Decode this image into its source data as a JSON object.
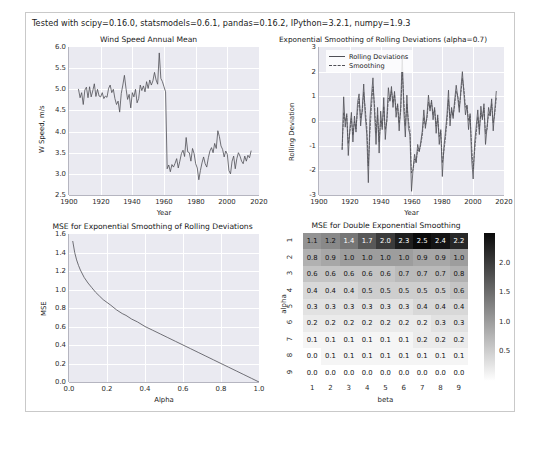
{
  "figure": {
    "note": "Tested with scipy=0.16.0, statsmodels=0.6.1, pandas=0.16.2, IPython=3.2.1, numpy=1.9.3",
    "background": "#ffffff",
    "axes_facecolor": "#eaeaf1",
    "grid_color": "#ffffff",
    "line_color": "#4f4f56"
  },
  "chart_data": [
    {
      "type": "line",
      "name": "wind-speed-annual-mean",
      "title": "Wind Speed Annual Mean",
      "xlabel": "Year",
      "ylabel": "W Speed, m/s",
      "xlim": [
        1900,
        2020
      ],
      "ylim": [
        2.5,
        6.0
      ],
      "xticks": [
        1900,
        1920,
        1940,
        1960,
        1980,
        2000,
        2020
      ],
      "xticklabels": [
        "1900",
        "1920",
        "1940",
        "1960",
        "1980",
        "2000",
        "2020"
      ],
      "yticks": [
        2.5,
        3.0,
        3.5,
        4.0,
        4.5,
        5.0,
        5.5,
        6.0
      ],
      "yticklabels": [
        "2.5",
        "3.0",
        "3.5",
        "4.0",
        "4.5",
        "5.0",
        "5.5",
        "6.0"
      ],
      "grid": true,
      "legend": null,
      "series": [
        {
          "name": "Wind Speed Annual Mean",
          "x": [
            1906,
            1907,
            1908,
            1909,
            1910,
            1911,
            1912,
            1913,
            1914,
            1915,
            1916,
            1917,
            1918,
            1919,
            1920,
            1921,
            1922,
            1923,
            1924,
            1925,
            1926,
            1927,
            1928,
            1929,
            1930,
            1931,
            1932,
            1933,
            1934,
            1935,
            1936,
            1937,
            1938,
            1939,
            1940,
            1941,
            1942,
            1943,
            1944,
            1945,
            1946,
            1947,
            1948,
            1949,
            1950,
            1951,
            1952,
            1953,
            1954,
            1955,
            1956,
            1957,
            1958,
            1959,
            1960,
            1961,
            1962,
            1963,
            1964,
            1965,
            1966,
            1967,
            1968,
            1969,
            1970,
            1971,
            1972,
            1973,
            1974,
            1975,
            1976,
            1977,
            1978,
            1979,
            1980,
            1981,
            1982,
            1983,
            1984,
            1985,
            1986,
            1987,
            1988,
            1989,
            1990,
            1991,
            1992,
            1993,
            1994,
            1995,
            1996,
            1997,
            1998,
            1999,
            2000,
            2001,
            2002,
            2003,
            2004,
            2005,
            2006,
            2007,
            2008,
            2009,
            2010,
            2011,
            2012,
            2013,
            2014,
            2015
          ],
          "y": [
            5.0,
            4.8,
            4.92,
            4.64,
            4.98,
            5.05,
            4.8,
            5.06,
            4.82,
            4.96,
            5.13,
            4.83,
            5.0,
            4.84,
            4.82,
            4.92,
            4.78,
            4.84,
            4.81,
            5.02,
            5.1,
            4.92,
            5.0,
            4.78,
            4.64,
            4.72,
            4.46,
            4.9,
            5.1,
            5.33,
            5.02,
            4.76,
            4.88,
            4.56,
            4.92,
            4.82,
            5.0,
            4.68,
            4.78,
            5.1,
            4.97,
            5.08,
            4.94,
            5.18,
            5.02,
            5.22,
            5.1,
            5.2,
            5.4,
            5.22,
            5.12,
            5.86,
            5.26,
            5.18,
            5.06,
            4.94,
            3.12,
            3.21,
            3.05,
            3.22,
            3.16,
            3.25,
            3.36,
            3.14,
            3.3,
            3.48,
            3.56,
            3.41,
            3.86,
            3.52,
            3.5,
            3.3,
            3.6,
            3.48,
            3.24,
            3.14,
            2.86,
            3.08,
            3.26,
            3.4,
            3.24,
            3.16,
            3.38,
            3.54,
            3.62,
            3.5,
            3.72,
            3.6,
            4.02,
            3.88,
            3.66,
            3.58,
            3.4,
            3.54,
            3.46,
            3.08,
            3.0,
            3.3,
            3.42,
            3.12,
            3.36,
            3.5,
            3.42,
            3.3,
            3.24,
            3.42,
            3.3,
            3.44,
            3.38,
            3.54
          ]
        }
      ]
    },
    {
      "type": "line",
      "name": "exponential-smoothing-rolling-deviations",
      "title": "Exponential Smoothing of Rolling Deviations (alpha=0.7)",
      "xlabel": "Year",
      "ylabel": "Rolling Deviation",
      "xlim": [
        1900,
        2020
      ],
      "ylim": [
        -3,
        3
      ],
      "xticks": [
        1900,
        1920,
        1940,
        1960,
        1980,
        2000,
        2020
      ],
      "xticklabels": [
        "1900",
        "1920",
        "1940",
        "1960",
        "1980",
        "2000",
        "2020"
      ],
      "yticks": [
        -3,
        -2,
        -1,
        0,
        1,
        2,
        3
      ],
      "yticklabels": [
        "-3",
        "-2",
        "-1",
        "0",
        "1",
        "2",
        "3"
      ],
      "grid": true,
      "legend": {
        "position": "upper left",
        "entries": [
          {
            "label": "Rolling Deviations",
            "style": "solid"
          },
          {
            "label": "Smoothing",
            "style": "dashed"
          }
        ]
      },
      "series": [
        {
          "name": "Rolling Deviations",
          "style": "solid",
          "x": [
            1915,
            1916,
            1917,
            1918,
            1919,
            1920,
            1921,
            1922,
            1923,
            1924,
            1925,
            1926,
            1927,
            1928,
            1929,
            1930,
            1931,
            1932,
            1933,
            1934,
            1935,
            1936,
            1937,
            1938,
            1939,
            1940,
            1941,
            1942,
            1943,
            1944,
            1945,
            1946,
            1947,
            1948,
            1949,
            1950,
            1951,
            1952,
            1953,
            1954,
            1955,
            1956,
            1957,
            1958,
            1959,
            1960,
            1961,
            1962,
            1963,
            1964,
            1965,
            1966,
            1967,
            1968,
            1969,
            1970,
            1971,
            1972,
            1973,
            1974,
            1975,
            1976,
            1977,
            1978,
            1979,
            1980,
            1981,
            1982,
            1983,
            1984,
            1985,
            1986,
            1987,
            1988,
            1989,
            1990,
            1991,
            1992,
            1993,
            1994,
            1995,
            1996,
            1997,
            1998,
            1999,
            2000,
            2001,
            2002,
            2003,
            2004,
            2005,
            2006,
            2007,
            2008,
            2009,
            2010,
            2011,
            2012,
            2013,
            2014,
            2015
          ],
          "y": [
            -1.15,
            0.98,
            -0.25,
            0.3,
            -1.4,
            -0.3,
            0.35,
            -0.85,
            0.2,
            -0.45,
            0.75,
            1.1,
            -0.2,
            0.45,
            1.5,
            0.2,
            -0.55,
            -2.5,
            0.1,
            1.0,
            1.75,
            0.35,
            -0.95,
            0.55,
            -1.3,
            0.4,
            -0.35,
            0.95,
            -0.75,
            0.1,
            1.35,
            0.8,
            1.4,
            0.55,
            1.2,
            0.15,
            0.7,
            -0.4,
            0.6,
            2.7,
            0.4,
            -0.65,
            1.05,
            -0.3,
            -0.55,
            -2.85,
            -1.95,
            -1.35,
            -1.7,
            -0.95,
            -1.25,
            -0.85,
            -0.4,
            0.45,
            -0.3,
            0.2,
            1.05,
            0.4,
            0.85,
            0.05,
            0.55,
            -0.5,
            0.25,
            -0.95,
            -0.35,
            -2.25,
            -1.05,
            -0.45,
            0.25,
            1.25,
            -0.2,
            0.55,
            0.1,
            0.85,
            1.45,
            0.95,
            0.35,
            1.3,
            2.0,
            1.1,
            0.25,
            0.65,
            -0.35,
            0.3,
            -1.55,
            -2.35,
            -0.85,
            -0.2,
            0.45,
            -0.55,
            0.6,
            0.05,
            0.7,
            -0.95,
            -0.25,
            0.55,
            0.2,
            0.9,
            -0.4,
            0.45,
            1.2,
            -0.25
          ]
        },
        {
          "name": "Smoothing",
          "style": "dashed",
          "x": [
            1915,
            1916,
            1917,
            1918,
            1919,
            1920,
            1921,
            1922,
            1923,
            1924,
            1925,
            1926,
            1927,
            1928,
            1929,
            1930,
            1931,
            1932,
            1933,
            1934,
            1935,
            1936,
            1937,
            1938,
            1939,
            1940,
            1941,
            1942,
            1943,
            1944,
            1945,
            1946,
            1947,
            1948,
            1949,
            1950,
            1951,
            1952,
            1953,
            1954,
            1955,
            1956,
            1957,
            1958,
            1959,
            1960,
            1961,
            1962,
            1963,
            1964,
            1965,
            1966,
            1967,
            1968,
            1969,
            1970,
            1971,
            1972,
            1973,
            1974,
            1975,
            1976,
            1977,
            1978,
            1979,
            1980,
            1981,
            1982,
            1983,
            1984,
            1985,
            1986,
            1987,
            1988,
            1989,
            1990,
            1991,
            1992,
            1993,
            1994,
            1995,
            1996,
            1997,
            1998,
            1999,
            2000,
            2001,
            2002,
            2003,
            2004,
            2005,
            2006,
            2007,
            2008,
            2009,
            2010,
            2011,
            2012,
            2013,
            2014,
            2015
          ],
          "y": [
            -1.15,
            0.34,
            0.0,
            0.21,
            -0.92,
            -0.49,
            0.1,
            -0.57,
            -0.02,
            -0.32,
            0.43,
            0.9,
            0.13,
            0.35,
            1.16,
            0.49,
            -0.24,
            -1.82,
            -0.48,
            0.56,
            1.39,
            0.66,
            -0.47,
            0.24,
            -0.84,
            0.03,
            -0.23,
            0.59,
            -0.35,
            -0.04,
            0.93,
            0.84,
            1.23,
            0.75,
            1.07,
            0.43,
            0.62,
            -0.09,
            0.39,
            1.99,
            0.88,
            -0.19,
            0.68,
            0.0,
            -0.38,
            -2.11,
            -1.99,
            -1.54,
            -1.65,
            -1.16,
            -1.22,
            -0.96,
            -0.57,
            0.15,
            -0.17,
            0.09,
            0.76,
            0.51,
            0.75,
            0.26,
            0.46,
            -0.21,
            0.11,
            -0.63,
            -0.43,
            -1.7,
            -1.24,
            -0.69,
            -0.03,
            0.87,
            0.12,
            0.42,
            0.2,
            0.65,
            1.21,
            1.03,
            0.55,
            1.08,
            1.72,
            1.29,
            0.56,
            0.62,
            0.01,
            0.21,
            -1.02,
            -1.95,
            -1.18,
            -0.49,
            0.17,
            -0.33,
            0.32,
            0.13,
            0.53,
            -0.51,
            -0.33,
            0.29,
            0.23,
            0.7,
            -0.07,
            0.29,
            0.93,
            0.11
          ]
        }
      ]
    },
    {
      "type": "line",
      "name": "mse-exponential-smoothing",
      "title": "MSE for Exponential Smoothing of Rolling Deviations",
      "xlabel": "Alpha",
      "ylabel": "MSE",
      "xlim": [
        0.0,
        1.0
      ],
      "ylim": [
        0.0,
        1.6
      ],
      "xticks": [
        0.0,
        0.2,
        0.4,
        0.6,
        0.8,
        1.0
      ],
      "xticklabels": [
        "0.0",
        "0.2",
        "0.4",
        "0.6",
        "0.8",
        "1.0"
      ],
      "yticks": [
        0.0,
        0.2,
        0.4,
        0.6,
        0.8,
        1.0,
        1.2,
        1.4,
        1.6
      ],
      "yticklabels": [
        "0.0",
        "0.2",
        "0.4",
        "0.6",
        "0.8",
        "1.0",
        "1.2",
        "1.4",
        "1.6"
      ],
      "grid": true,
      "legend": null,
      "series": [
        {
          "name": "MSE",
          "style": "solid",
          "x": [
            0.02,
            0.03,
            0.04,
            0.05,
            0.06,
            0.08,
            0.1,
            0.12,
            0.14,
            0.16,
            0.18,
            0.2,
            0.22,
            0.25,
            0.28,
            0.3,
            0.33,
            0.36,
            0.4,
            0.44,
            0.48,
            0.52,
            0.56,
            0.6,
            0.64,
            0.68,
            0.72,
            0.76,
            0.8,
            0.84,
            0.88,
            0.92,
            0.96,
            1.0
          ],
          "y": [
            1.52,
            1.4,
            1.32,
            1.26,
            1.21,
            1.13,
            1.07,
            1.02,
            0.97,
            0.93,
            0.89,
            0.86,
            0.83,
            0.78,
            0.74,
            0.72,
            0.68,
            0.65,
            0.6,
            0.56,
            0.52,
            0.48,
            0.44,
            0.4,
            0.36,
            0.32,
            0.28,
            0.24,
            0.2,
            0.16,
            0.12,
            0.08,
            0.04,
            0.0
          ]
        }
      ]
    },
    {
      "type": "heatmap",
      "name": "mse-double-exponential-smoothing",
      "title": "MSE for Double Exponential Smoothing",
      "xlabel": "beta",
      "ylabel": "alpha",
      "xticklabels": [
        "1",
        "2",
        "3",
        "4",
        "5",
        "6",
        "7",
        "8",
        "9"
      ],
      "yticklabels": [
        "1",
        "2",
        "3",
        "4",
        "5",
        "6",
        "7",
        "8",
        "9"
      ],
      "cmap": "gray_r",
      "vmin": 0.0,
      "vmax": 2.5,
      "colorbar": {
        "ticks": [
          0.5,
          1.0,
          1.5,
          2.0
        ],
        "ticklabels": [
          "0.5",
          "1.0",
          "1.5",
          "2.0"
        ]
      },
      "values": [
        [
          1.1,
          1.2,
          1.4,
          1.7,
          2.0,
          2.3,
          2.5,
          2.4,
          2.2
        ],
        [
          0.8,
          0.9,
          1.0,
          1.0,
          1.0,
          1.0,
          0.9,
          0.9,
          1.0
        ],
        [
          0.6,
          0.6,
          0.6,
          0.6,
          0.6,
          0.7,
          0.7,
          0.7,
          0.8
        ],
        [
          0.4,
          0.4,
          0.4,
          0.5,
          0.5,
          0.5,
          0.5,
          0.5,
          0.6
        ],
        [
          0.3,
          0.3,
          0.3,
          0.3,
          0.3,
          0.3,
          0.4,
          0.4,
          0.4
        ],
        [
          0.2,
          0.2,
          0.2,
          0.2,
          0.2,
          0.2,
          0.2,
          0.3,
          0.3
        ],
        [
          0.1,
          0.1,
          0.1,
          0.1,
          0.1,
          0.1,
          0.2,
          0.2,
          0.2
        ],
        [
          0.0,
          0.1,
          0.1,
          0.1,
          0.1,
          0.1,
          0.1,
          0.1,
          0.1
        ],
        [
          0.0,
          0.0,
          0.0,
          0.0,
          0.0,
          0.0,
          0.0,
          0.0,
          0.0
        ]
      ],
      "labels": [
        [
          "1.1",
          "1.2",
          "1.4",
          "1.7",
          "2.0",
          "2.3",
          "2.5",
          "2.4",
          "2.2"
        ],
        [
          "0.8",
          "0.9",
          "1.0",
          "1.0",
          "1.0",
          "1.0",
          "0.9",
          "0.9",
          "1.0"
        ],
        [
          "0.6",
          "0.6",
          "0.6",
          "0.6",
          "0.6",
          "0.7",
          "0.7",
          "0.7",
          "0.8"
        ],
        [
          "0.4",
          "0.4",
          "0.4",
          "0.5",
          "0.5",
          "0.5",
          "0.5",
          "0.5",
          "0.6"
        ],
        [
          "0.3",
          "0.3",
          "0.3",
          "0.3",
          "0.3",
          "0.3",
          "0.4",
          "0.4",
          "0.4"
        ],
        [
          "0.2",
          "0.2",
          "0.2",
          "0.2",
          "0.2",
          "0.2",
          "0.2",
          "0.3",
          "0.3"
        ],
        [
          "0.1",
          "0.1",
          "0.1",
          "0.1",
          "0.1",
          "0.1",
          "0.2",
          "0.2",
          "0.2"
        ],
        [
          "0.0",
          "0.1",
          "0.1",
          "0.1",
          "0.1",
          "0.1",
          "0.1",
          "0.1",
          "0.1"
        ],
        [
          "0.0",
          "0.0",
          "0.0",
          "0.0",
          "0.0",
          "0.0",
          "0.0",
          "0.0",
          "0.0"
        ]
      ]
    }
  ]
}
